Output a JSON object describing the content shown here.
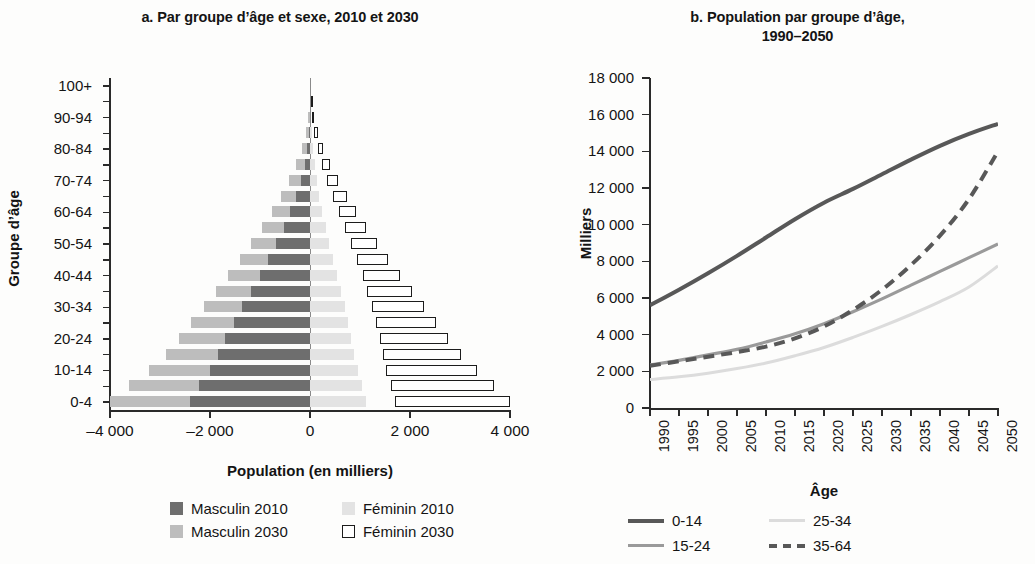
{
  "panel_a": {
    "title": "a. Par groupe d’âge et sexe, 2010 et 2030",
    "x_title": "Population (en milliers)",
    "y_title": "Groupe d’âge",
    "legend": [
      {
        "key": "m2010",
        "label": "Masculin 2010",
        "color": "#6e6e6e"
      },
      {
        "key": "f2010",
        "label": "Féminin 2010",
        "color": "#e3e3e3"
      },
      {
        "key": "m2030",
        "label": "Masculin 2030",
        "color": "#bdbdbd"
      },
      {
        "key": "f2030",
        "label": "Féminin 2030",
        "color": "#ffffff"
      }
    ]
  },
  "panel_b": {
    "title_line1": "b. Population par groupe d’âge,",
    "title_line2": "1990–2050",
    "x_title": "Âge",
    "y_title": "Milliers",
    "legend": [
      {
        "key": "0-14",
        "label": "0-14",
        "style": "solid",
        "color": "#585858"
      },
      {
        "key": "25-34",
        "label": "25-34",
        "style": "solid",
        "color": "#dcdcdc"
      },
      {
        "key": "15-24",
        "label": "15-24",
        "style": "solid",
        "color": "#9a9a9a"
      },
      {
        "key": "35-64",
        "label": "35-64",
        "style": "dashed",
        "color": "#585858"
      }
    ]
  },
  "chart_data": [
    {
      "type": "bar",
      "orientation": "horizontal",
      "subtype": "population-pyramid",
      "title": "a. Par groupe d’âge et sexe, 2010 et 2030",
      "xlabel": "Population (en milliers)",
      "ylabel": "Groupe d’âge",
      "xlim": [
        -4000,
        4000
      ],
      "xticks": [
        -4000,
        -2000,
        0,
        2000,
        4000
      ],
      "xticklabels": [
        "–4 000",
        "–2 000",
        "0",
        "2 000",
        "4 000"
      ],
      "grid": false,
      "categories": [
        "0-4",
        "5-9",
        "10-14",
        "15-19",
        "20-24",
        "25-29",
        "30-34",
        "35-39",
        "40-44",
        "45-49",
        "50-54",
        "55-59",
        "60-64",
        "65-69",
        "70-74",
        "75-79",
        "80-84",
        "85-89",
        "90-94",
        "95-99",
        "100+"
      ],
      "ytick_labels_shown": [
        "0-4",
        "10-14",
        "20-24",
        "30-34",
        "40-44",
        "50-54",
        "60-64",
        "70-74",
        "80-84",
        "90-94",
        "100+"
      ],
      "series": [
        {
          "name": "Masculin 2010",
          "color": "#6e6e6e",
          "direction": "left",
          "values": [
            -2400,
            -2230,
            -2010,
            -1850,
            -1700,
            -1530,
            -1370,
            -1180,
            -1010,
            -840,
            -680,
            -530,
            -395,
            -275,
            -180,
            -110,
            -62,
            -30,
            -11,
            -3,
            -1
          ]
        },
        {
          "name": "Masculin 2030",
          "color": "#bdbdbd",
          "direction": "left",
          "values": [
            -4000,
            -3620,
            -3220,
            -2880,
            -2620,
            -2390,
            -2130,
            -1880,
            -1640,
            -1400,
            -1180,
            -960,
            -760,
            -580,
            -420,
            -280,
            -170,
            -90,
            -38,
            -11,
            -3
          ]
        },
        {
          "name": "Féminin 2010",
          "color": "#e3e3e3",
          "direction": "right",
          "values": [
            1110,
            1030,
            950,
            880,
            820,
            760,
            690,
            610,
            530,
            455,
            380,
            310,
            245,
            185,
            135,
            92,
            57,
            30,
            12,
            3,
            1
          ]
        },
        {
          "name": "Féminin 2030",
          "color": "#ffffff",
          "direction": "right",
          "floating": true,
          "start": [
            1700,
            1620,
            1520,
            1450,
            1390,
            1320,
            1240,
            1140,
            1050,
            930,
            820,
            690,
            570,
            450,
            340,
            240,
            150,
            85,
            38,
            13,
            4
          ],
          "values": [
            4000,
            3680,
            3340,
            3020,
            2760,
            2520,
            2280,
            2040,
            1790,
            1560,
            1330,
            1120,
            920,
            730,
            560,
            400,
            260,
            150,
            70,
            25,
            8
          ]
        }
      ]
    },
    {
      "type": "line",
      "title": "b. Population par groupe d’âge, 1990–2050",
      "xlabel": "Âge",
      "ylabel": "Milliers",
      "ylim": [
        0,
        18000
      ],
      "yticks": [
        0,
        2000,
        4000,
        6000,
        8000,
        10000,
        12000,
        14000,
        16000,
        18000
      ],
      "yticklabels": [
        "0",
        "2 000",
        "4 000",
        "6 000",
        "8 000",
        "10 000",
        "12 000",
        "14 000",
        "16 000",
        "18 000"
      ],
      "x": [
        1990,
        1995,
        2000,
        2005,
        2010,
        2015,
        2020,
        2025,
        2030,
        2035,
        2040,
        2045,
        2050
      ],
      "xticklabels": [
        "1990",
        "1995",
        "2000",
        "2005",
        "2010",
        "2015",
        "2020",
        "2025",
        "2030",
        "2035",
        "2040",
        "2045",
        "2050"
      ],
      "grid": false,
      "legend_position": "bottom",
      "series": [
        {
          "name": "0-14",
          "color": "#585858",
          "style": "solid",
          "width": 4,
          "values": [
            5600,
            6450,
            7350,
            8300,
            9300,
            10300,
            11200,
            11950,
            12750,
            13550,
            14300,
            14950,
            15500
          ]
        },
        {
          "name": "15-24",
          "color": "#9a9a9a",
          "style": "solid",
          "width": 3.2,
          "values": [
            2350,
            2600,
            2900,
            3200,
            3600,
            4050,
            4600,
            5250,
            5950,
            6700,
            7450,
            8200,
            8950
          ]
        },
        {
          "name": "25-34",
          "color": "#dcdcdc",
          "style": "solid",
          "width": 3,
          "values": [
            1550,
            1700,
            1900,
            2150,
            2450,
            2850,
            3300,
            3850,
            4450,
            5100,
            5800,
            6600,
            7750
          ]
        },
        {
          "name": "35-64",
          "color": "#585858",
          "style": "dashed",
          "width": 4,
          "values": [
            2300,
            2550,
            2800,
            3050,
            3350,
            3800,
            4450,
            5350,
            6450,
            7800,
            9400,
            11400,
            14000
          ]
        }
      ]
    }
  ]
}
